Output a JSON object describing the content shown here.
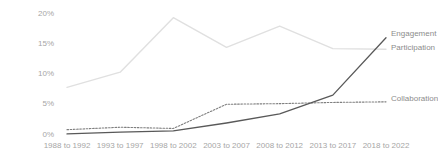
{
  "chart_data": {
    "type": "line",
    "title": "",
    "xlabel": "",
    "ylabel": "",
    "ylim": [
      0,
      20
    ],
    "ytick_labels": [
      "0%",
      "5%",
      "10%",
      "15%",
      "20%"
    ],
    "ytick_values": [
      0,
      5,
      10,
      15,
      20
    ],
    "grid": false,
    "legend_position": "right-inline-end-of-line",
    "categories": [
      "1988 to 1992",
      "1993 to 1997",
      "1998 to 2002",
      "2003 to 2007",
      "2008 to 2012",
      "2013 to 2017",
      "2018 to 2022"
    ],
    "series": [
      {
        "name": "Engagement",
        "style": "solid",
        "color": "#595959",
        "values": [
          0.1,
          0.4,
          0.6,
          1.9,
          3.4,
          6.5,
          16.0
        ]
      },
      {
        "name": "Participation",
        "style": "solid",
        "color": "#e0e0e0",
        "values": [
          7.8,
          10.3,
          19.3,
          14.4,
          17.9,
          14.2,
          14.1
        ]
      },
      {
        "name": "Collaboration",
        "style": "dotted",
        "color": "#7f7f7f",
        "values": [
          0.8,
          1.2,
          1.0,
          5.0,
          5.1,
          5.3,
          5.4
        ]
      }
    ]
  },
  "axis": {
    "y_ticks": [
      {
        "label": "20%",
        "value": 20
      },
      {
        "label": "15%",
        "value": 15
      },
      {
        "label": "10%",
        "value": 10
      },
      {
        "label": "5%",
        "value": 5
      },
      {
        "label": "0%",
        "value": 0
      }
    ],
    "x_ticks": [
      {
        "label": "1988 to 1992"
      },
      {
        "label": "1993 to 1997"
      },
      {
        "label": "1998 to 2002"
      },
      {
        "label": "2003 to 2007"
      },
      {
        "label": "2008 to 2012"
      },
      {
        "label": "2013 to 2017"
      },
      {
        "label": "2018 to 2022"
      }
    ]
  },
  "legend": {
    "engagement": "Engagement",
    "participation": "Participation",
    "collaboration": "Collaboration"
  },
  "colors": {
    "engagement": "#595959",
    "participation": "#e0e0e0",
    "collaboration": "#7f7f7f",
    "axis_text": "#a6a6a6",
    "legend_text": "#8c8c8c",
    "background": "#ffffff"
  }
}
